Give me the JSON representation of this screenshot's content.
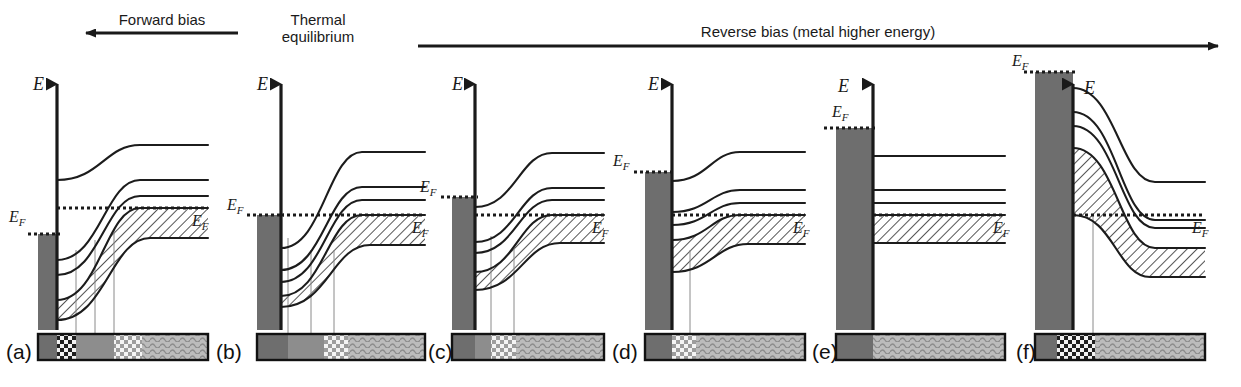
{
  "figure": {
    "width": 1241,
    "height": 387,
    "caption_arrows": [
      {
        "id": "forward-bias",
        "label": "Forward bias",
        "direction": "left",
        "x1": 86,
        "x2": 238,
        "y": 33,
        "label_x": 162,
        "label_y": 12
      },
      {
        "id": "reverse-bias",
        "label": "Reverse bias (metal higher energy)",
        "direction": "right",
        "x1": 418,
        "x2": 1218,
        "y": 46,
        "label_x": 818,
        "label_y": 24
      },
      {
        "id": "thermal-equilibrium",
        "label": "Thermal\nequilibrium",
        "direction": "none",
        "label_x": 318,
        "label_y": 12
      }
    ],
    "colors": {
      "ink": "#1a1a1a",
      "metal_fill": "#6e6e6e",
      "bar_dark": "#6e6e6e",
      "bar_mid": "#8d8d8d",
      "bar_light": "#b4b4b4",
      "band_line": "#1c1c1c",
      "hatch": "#2a2a2a",
      "tie_line": "#8a8a8a"
    },
    "axis_symbol": "E",
    "fermi_symbol": "E",
    "fermi_subscript": "F"
  },
  "panels": [
    {
      "tag": "(a)",
      "tag_x": 6,
      "tag_y": 340,
      "bias_state": "forward-bias-strong",
      "origin_x": 57,
      "axis_x": 57,
      "axis_top": 72,
      "axis_bottom": 330,
      "axis_label_x": 33,
      "axis_label_y": 74,
      "metal": {
        "x": 38,
        "width": 19,
        "top": 234,
        "bottom": 330
      },
      "metal_ef": {
        "y": 234,
        "x1": 28,
        "x2": 60,
        "label_x": 9,
        "label_y": 208,
        "label_visible": true
      },
      "semi_ef": {
        "y": 208,
        "x1": 57,
        "x2": 208,
        "label_x": 192,
        "label_y": 212,
        "label_visible": true
      },
      "bands": [
        {
          "name": "upper-band",
          "y_edge": 180,
          "y_flat": 145,
          "x_start": 57,
          "x_flat": 140,
          "x_end": 208
        },
        {
          "name": "mid-band-upper",
          "y_edge": 260,
          "y_flat": 180,
          "x_start": 57,
          "x_flat": 140,
          "x_end": 208
        },
        {
          "name": "mid-band-lower",
          "y_edge": 275,
          "y_flat": 196,
          "x_start": 57,
          "x_flat": 140,
          "x_end": 208
        },
        {
          "name": "valence-band-top",
          "y_edge": 300,
          "y_flat": 208,
          "x_start": 57,
          "x_flat": 140,
          "x_end": 208
        },
        {
          "name": "valence-band-bottom",
          "y_edge": 320,
          "y_flat": 238,
          "x_start": 57,
          "x_flat": 150,
          "x_end": 208
        }
      ],
      "filled_region": {
        "top_band": "valence-band-top",
        "bottom_band": "valence-band-bottom",
        "hatched": true
      },
      "tie_lines": [
        {
          "x": 76,
          "y_top": 250,
          "y_bottom": 334
        },
        {
          "x": 95,
          "y_top": 240,
          "y_bottom": 334
        },
        {
          "x": 114,
          "y_top": 230,
          "y_bottom": 334
        }
      ],
      "bottom_bar": {
        "x": 38,
        "y": 334,
        "width": 170,
        "height": 26,
        "segments": [
          {
            "pattern": "solid-dark",
            "width": 19
          },
          {
            "pattern": "checker-dark",
            "width": 19
          },
          {
            "pattern": "solid-mid",
            "width": 38
          },
          {
            "pattern": "checker-light",
            "width": 28
          },
          {
            "pattern": "wave-light",
            "width": 66
          }
        ]
      }
    },
    {
      "tag": "(b)",
      "tag_x": 216,
      "tag_y": 340,
      "bias_state": "thermal-equilibrium",
      "origin_x": 281,
      "axis_x": 281,
      "axis_top": 72,
      "axis_bottom": 330,
      "axis_label_x": 257,
      "axis_label_y": 74,
      "metal": {
        "x": 257,
        "width": 24,
        "top": 215,
        "bottom": 330
      },
      "metal_ef": {
        "y": 215,
        "x1": 247,
        "x2": 284,
        "label_x": 227,
        "label_y": 196,
        "label_visible": true
      },
      "semi_ef": {
        "y": 215,
        "x1": 281,
        "x2": 425,
        "label_x": 412,
        "label_y": 219,
        "label_visible": true
      },
      "bands": [
        {
          "name": "upper-band",
          "y_edge": 248,
          "y_flat": 152,
          "x_start": 281,
          "x_flat": 362,
          "x_end": 425
        },
        {
          "name": "mid-band-upper",
          "y_edge": 270,
          "y_flat": 187,
          "x_start": 281,
          "x_flat": 362,
          "x_end": 425
        },
        {
          "name": "mid-band-lower",
          "y_edge": 282,
          "y_flat": 200,
          "x_start": 281,
          "x_flat": 362,
          "x_end": 425
        },
        {
          "name": "valence-band-top",
          "y_edge": 296,
          "y_flat": 215,
          "x_start": 281,
          "x_flat": 362,
          "x_end": 425
        },
        {
          "name": "valence-band-bottom",
          "y_edge": 307,
          "y_flat": 245,
          "x_start": 281,
          "x_flat": 370,
          "x_end": 425
        }
      ],
      "filled_region": {
        "top_band": "valence-band-top",
        "bottom_band": "valence-band-bottom",
        "hatched": true
      },
      "tie_lines": [
        {
          "x": 288,
          "y_top": 238,
          "y_bottom": 334
        },
        {
          "x": 311,
          "y_top": 250,
          "y_bottom": 334
        },
        {
          "x": 334,
          "y_top": 250,
          "y_bottom": 334
        }
      ],
      "bottom_bar": {
        "x": 257,
        "y": 334,
        "width": 168,
        "height": 26,
        "segments": [
          {
            "pattern": "solid-dark",
            "width": 31
          },
          {
            "pattern": "solid-mid",
            "width": 36
          },
          {
            "pattern": "checker-light",
            "width": 24
          },
          {
            "pattern": "wave-light",
            "width": 77
          }
        ]
      }
    },
    {
      "tag": "(c)",
      "tag_x": 428,
      "tag_y": 340,
      "bias_state": "reverse-bias-small",
      "origin_x": 475,
      "axis_x": 475,
      "axis_top": 72,
      "axis_bottom": 330,
      "axis_label_x": 452,
      "axis_label_y": 74,
      "metal": {
        "x": 452,
        "width": 23,
        "top": 197,
        "bottom": 330
      },
      "metal_ef": {
        "y": 197,
        "x1": 441,
        "x2": 478,
        "label_x": 420,
        "label_y": 178,
        "label_visible": true
      },
      "semi_ef": {
        "y": 215,
        "x1": 475,
        "x2": 604,
        "label_x": 592,
        "label_y": 219,
        "label_visible": true
      },
      "bands": [
        {
          "name": "upper-band",
          "y_edge": 207,
          "y_flat": 153,
          "x_start": 475,
          "x_flat": 552,
          "x_end": 604
        },
        {
          "name": "mid-band-upper",
          "y_edge": 242,
          "y_flat": 188,
          "x_start": 475,
          "x_flat": 552,
          "x_end": 604
        },
        {
          "name": "mid-band-lower",
          "y_edge": 253,
          "y_flat": 200,
          "x_start": 475,
          "x_flat": 552,
          "x_end": 604
        },
        {
          "name": "valence-band-top",
          "y_edge": 272,
          "y_flat": 215,
          "x_start": 475,
          "x_flat": 552,
          "x_end": 604
        },
        {
          "name": "valence-band-bottom",
          "y_edge": 290,
          "y_flat": 243,
          "x_start": 475,
          "x_flat": 560,
          "x_end": 604
        }
      ],
      "filled_region": {
        "top_band": "valence-band-top",
        "bottom_band": "valence-band-bottom",
        "hatched": true
      },
      "tie_lines": [
        {
          "x": 491,
          "y_top": 236,
          "y_bottom": 334
        },
        {
          "x": 514,
          "y_top": 246,
          "y_bottom": 334
        }
      ],
      "bottom_bar": {
        "x": 452,
        "y": 334,
        "width": 152,
        "height": 26,
        "segments": [
          {
            "pattern": "solid-dark",
            "width": 23
          },
          {
            "pattern": "solid-mid",
            "width": 16
          },
          {
            "pattern": "checker-light",
            "width": 25
          },
          {
            "pattern": "wave-light",
            "width": 88
          }
        ]
      }
    },
    {
      "tag": "(d)",
      "tag_x": 612,
      "tag_y": 340,
      "bias_state": "reverse-bias-medium",
      "origin_x": 672,
      "axis_x": 672,
      "axis_top": 72,
      "axis_bottom": 330,
      "axis_label_x": 648,
      "axis_label_y": 74,
      "metal": {
        "x": 645,
        "width": 27,
        "top": 172,
        "bottom": 330
      },
      "metal_ef": {
        "y": 172,
        "x1": 634,
        "x2": 675,
        "label_x": 613,
        "label_y": 152,
        "label_visible": true
      },
      "semi_ef": {
        "y": 215,
        "x1": 672,
        "x2": 805,
        "label_x": 793,
        "label_y": 219,
        "label_visible": true
      },
      "bands": [
        {
          "name": "upper-band",
          "y_edge": 181,
          "y_flat": 152,
          "x_start": 672,
          "x_flat": 740,
          "x_end": 805
        },
        {
          "name": "mid-band-upper",
          "y_edge": 212,
          "y_flat": 190,
          "x_start": 672,
          "x_flat": 740,
          "x_end": 805
        },
        {
          "name": "mid-band-lower",
          "y_edge": 225,
          "y_flat": 203,
          "x_start": 672,
          "x_flat": 740,
          "x_end": 805
        },
        {
          "name": "valence-band-top",
          "y_edge": 240,
          "y_flat": 215,
          "x_start": 672,
          "x_flat": 740,
          "x_end": 805
        },
        {
          "name": "valence-band-bottom",
          "y_edge": 272,
          "y_flat": 244,
          "x_start": 672,
          "x_flat": 748,
          "x_end": 805
        }
      ],
      "filled_region": {
        "top_band": "valence-band-top",
        "bottom_band": "valence-band-bottom",
        "hatched": true
      },
      "tie_lines": [
        {
          "x": 690,
          "y_top": 250,
          "y_bottom": 334
        }
      ],
      "bottom_bar": {
        "x": 645,
        "y": 334,
        "width": 160,
        "height": 26,
        "segments": [
          {
            "pattern": "solid-dark",
            "width": 27
          },
          {
            "pattern": "checker-light",
            "width": 24
          },
          {
            "pattern": "wave-light",
            "width": 109
          }
        ]
      }
    },
    {
      "tag": "(e)",
      "tag_x": 812,
      "tag_y": 340,
      "bias_state": "flat-band",
      "origin_x": 873,
      "axis_x": 873,
      "axis_top": 72,
      "axis_bottom": 330,
      "axis_label_x": 838,
      "axis_label_y": 76,
      "metal": {
        "x": 836,
        "width": 37,
        "top": 128,
        "bottom": 330
      },
      "metal_ef": {
        "y": 128,
        "x1": 824,
        "x2": 876,
        "label_x": 832,
        "label_y": 103,
        "label_visible": true
      },
      "semi_ef": {
        "y": 215,
        "x1": 873,
        "x2": 1005,
        "label_x": 993,
        "label_y": 219,
        "label_visible": true
      },
      "bands": [
        {
          "name": "upper-band",
          "y_edge": 156,
          "y_flat": 156,
          "x_start": 873,
          "x_flat": 873,
          "x_end": 1005
        },
        {
          "name": "mid-band-upper",
          "y_edge": 190,
          "y_flat": 190,
          "x_start": 873,
          "x_flat": 873,
          "x_end": 1005
        },
        {
          "name": "mid-band-lower",
          "y_edge": 203,
          "y_flat": 203,
          "x_start": 873,
          "x_flat": 873,
          "x_end": 1005
        },
        {
          "name": "valence-band-top",
          "y_edge": 215,
          "y_flat": 215,
          "x_start": 873,
          "x_flat": 873,
          "x_end": 1005
        },
        {
          "name": "valence-band-bottom",
          "y_edge": 243,
          "y_flat": 243,
          "x_start": 873,
          "x_flat": 873,
          "x_end": 1005
        }
      ],
      "filled_region": {
        "top_band": "valence-band-top",
        "bottom_band": "valence-band-bottom",
        "hatched": true
      },
      "tie_lines": [],
      "bottom_bar": {
        "x": 836,
        "y": 334,
        "width": 169,
        "height": 26,
        "segments": [
          {
            "pattern": "solid-dark",
            "width": 37
          },
          {
            "pattern": "wave-light",
            "width": 132
          }
        ]
      }
    },
    {
      "tag": "(f)",
      "tag_x": 1016,
      "tag_y": 340,
      "bias_state": "reverse-bias-accumulation",
      "origin_x": 1073,
      "axis_x": 1073,
      "axis_top": 72,
      "axis_bottom": 330,
      "axis_label_x": 1084,
      "axis_label_y": 78,
      "metal": {
        "x": 1035,
        "width": 38,
        "top": 72,
        "bottom": 330
      },
      "metal_ef": {
        "y": 72,
        "x1": 1024,
        "x2": 1076,
        "label_x": 1012,
        "label_y": 52,
        "label_visible": true
      },
      "semi_ef": {
        "y": 215,
        "x1": 1073,
        "x2": 1205,
        "label_x": 1192,
        "label_y": 219,
        "label_visible": true
      },
      "bands": [
        {
          "name": "upper-band",
          "y_edge": 88,
          "y_flat": 182,
          "x_start": 1073,
          "x_flat": 1155,
          "x_end": 1205
        },
        {
          "name": "mid-band-upper",
          "y_edge": 112,
          "y_flat": 220,
          "x_start": 1073,
          "x_flat": 1155,
          "x_end": 1205
        },
        {
          "name": "mid-band-lower",
          "y_edge": 126,
          "y_flat": 228,
          "x_start": 1073,
          "x_flat": 1155,
          "x_end": 1205
        },
        {
          "name": "valence-band-top",
          "y_edge": 148,
          "y_flat": 248,
          "x_start": 1073,
          "x_flat": 1155,
          "x_end": 1205
        },
        {
          "name": "valence-band-bottom",
          "y_edge": 215,
          "y_flat": 277,
          "x_start": 1073,
          "x_flat": 1150,
          "x_end": 1205
        }
      ],
      "filled_region": {
        "top_band": "valence-band-top",
        "bottom_band": "valence-band-bottom",
        "hatched": true
      },
      "tie_lines": [
        {
          "x": 1093,
          "y_top": 215,
          "y_bottom": 334
        }
      ],
      "bottom_bar": {
        "x": 1035,
        "y": 334,
        "width": 170,
        "height": 26,
        "segments": [
          {
            "pattern": "solid-dark",
            "width": 22
          },
          {
            "pattern": "checker-dark",
            "width": 38
          },
          {
            "pattern": "wave-light",
            "width": 110
          }
        ]
      }
    }
  ]
}
